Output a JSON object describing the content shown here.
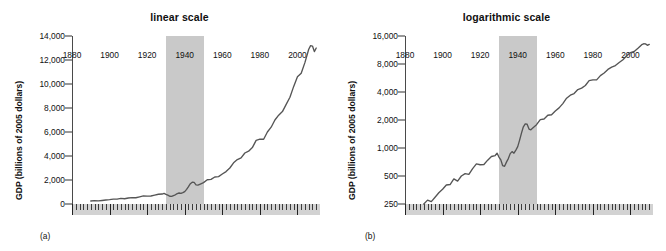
{
  "figure": {
    "panels": [
      {
        "id": "a",
        "sublabel": "(a)",
        "title": "linear scale",
        "ylabel": "GDP (billions of 2005 dollars)"
      },
      {
        "id": "b",
        "sublabel": "(b)",
        "title": "logarithmic scale",
        "ylabel": "GDP (billions of 2005 dollars)"
      }
    ]
  },
  "chart_data": [
    {
      "type": "line",
      "title": "linear scale",
      "xlabel": "",
      "ylabel": "GDP (billions of 2005 dollars)",
      "yscale": "linear",
      "xlim": [
        1880,
        2012
      ],
      "ylim": [
        0,
        14000
      ],
      "yticks": [
        0,
        2000,
        4000,
        6000,
        8000,
        10000,
        12000,
        14000
      ],
      "ytick_labels": [
        "0",
        "2,000",
        "4,000",
        "6,000",
        "8,000",
        "10,000",
        "12,000",
        "14,000"
      ],
      "xticks": [
        1880,
        1900,
        1920,
        1940,
        1960,
        1980,
        2000
      ],
      "xtick_labels": [
        "1880",
        "1900",
        "1920",
        "1940",
        "1960",
        "1980",
        "2000"
      ],
      "minor_tick_interval": 2,
      "grid": false,
      "legend": "none",
      "annotations": [
        {
          "type": "shaded-band",
          "name": "depression-war-band",
          "x_start": 1930,
          "x_end": 1950,
          "color": "#c9c9c9"
        }
      ],
      "x": [
        1890,
        1892,
        1894,
        1896,
        1898,
        1900,
        1902,
        1904,
        1906,
        1908,
        1910,
        1912,
        1914,
        1916,
        1918,
        1920,
        1922,
        1924,
        1926,
        1928,
        1929,
        1930,
        1931,
        1932,
        1933,
        1934,
        1935,
        1936,
        1937,
        1938,
        1939,
        1940,
        1941,
        1942,
        1943,
        1944,
        1945,
        1946,
        1947,
        1948,
        1950,
        1952,
        1954,
        1956,
        1958,
        1960,
        1962,
        1964,
        1966,
        1968,
        1970,
        1972,
        1974,
        1976,
        1978,
        1980,
        1982,
        1984,
        1986,
        1988,
        1990,
        1992,
        1994,
        1996,
        1998,
        2000,
        2002,
        2004,
        2006,
        2007,
        2008,
        2009,
        2010
      ],
      "y": [
        250,
        275,
        265,
        295,
        330,
        360,
        400,
        405,
        465,
        440,
        500,
        530,
        520,
        600,
        675,
        660,
        665,
        740,
        810,
        830,
        880,
        800,
        745,
        645,
        635,
        705,
        770,
        870,
        915,
        880,
        950,
        1035,
        1215,
        1445,
        1690,
        1820,
        1800,
        1600,
        1570,
        1640,
        1780,
        2020,
        2050,
        2250,
        2280,
        2500,
        2700,
        3000,
        3430,
        3700,
        3850,
        4250,
        4400,
        4700,
        5300,
        5400,
        5400,
        6000,
        6400,
        7000,
        7400,
        7700,
        8300,
        8900,
        9800,
        10600,
        10900,
        11800,
        12900,
        13200,
        13160,
        12700,
        13000
      ]
    },
    {
      "type": "line",
      "title": "logarithmic scale",
      "xlabel": "",
      "ylabel": "GDP (billions of 2005 dollars)",
      "yscale": "log",
      "xlim": [
        1880,
        2012
      ],
      "ylim": [
        250,
        16000
      ],
      "yticks": [
        250,
        500,
        1000,
        2000,
        4000,
        8000,
        16000
      ],
      "ytick_labels": [
        "250",
        "500",
        "1,000",
        "2,000",
        "4,000",
        "8,000",
        "16,000"
      ],
      "xticks": [
        1880,
        1900,
        1920,
        1940,
        1960,
        1980,
        2000
      ],
      "xtick_labels": [
        "1880",
        "1900",
        "1920",
        "1940",
        "1960",
        "1980",
        "2000"
      ],
      "minor_tick_interval": 2,
      "grid": false,
      "legend": "none",
      "annotations": [
        {
          "type": "shaded-band",
          "name": "depression-war-band",
          "x_start": 1930,
          "x_end": 1950,
          "color": "#c9c9c9"
        }
      ],
      "x": [
        1890,
        1892,
        1894,
        1896,
        1898,
        1900,
        1902,
        1904,
        1906,
        1908,
        1910,
        1912,
        1914,
        1916,
        1918,
        1920,
        1922,
        1924,
        1926,
        1928,
        1929,
        1930,
        1931,
        1932,
        1933,
        1934,
        1935,
        1936,
        1937,
        1938,
        1939,
        1940,
        1941,
        1942,
        1943,
        1944,
        1945,
        1946,
        1947,
        1948,
        1950,
        1952,
        1954,
        1956,
        1958,
        1960,
        1962,
        1964,
        1966,
        1968,
        1970,
        1972,
        1974,
        1976,
        1978,
        1980,
        1982,
        1984,
        1986,
        1988,
        1990,
        1992,
        1994,
        1996,
        1998,
        2000,
        2002,
        2004,
        2006,
        2007,
        2008,
        2009,
        2010
      ],
      "y": [
        250,
        275,
        265,
        295,
        330,
        360,
        400,
        405,
        465,
        440,
        500,
        530,
        520,
        600,
        675,
        660,
        665,
        740,
        810,
        830,
        880,
        800,
        745,
        645,
        635,
        705,
        770,
        870,
        915,
        880,
        950,
        1035,
        1215,
        1445,
        1690,
        1820,
        1800,
        1600,
        1570,
        1640,
        1780,
        2020,
        2050,
        2250,
        2280,
        2500,
        2700,
        3000,
        3430,
        3700,
        3850,
        4250,
        4400,
        4700,
        5300,
        5400,
        5400,
        6000,
        6400,
        7000,
        7400,
        7700,
        8300,
        8900,
        9800,
        10600,
        10900,
        11800,
        12900,
        13200,
        13160,
        12700,
        13000
      ]
    }
  ]
}
